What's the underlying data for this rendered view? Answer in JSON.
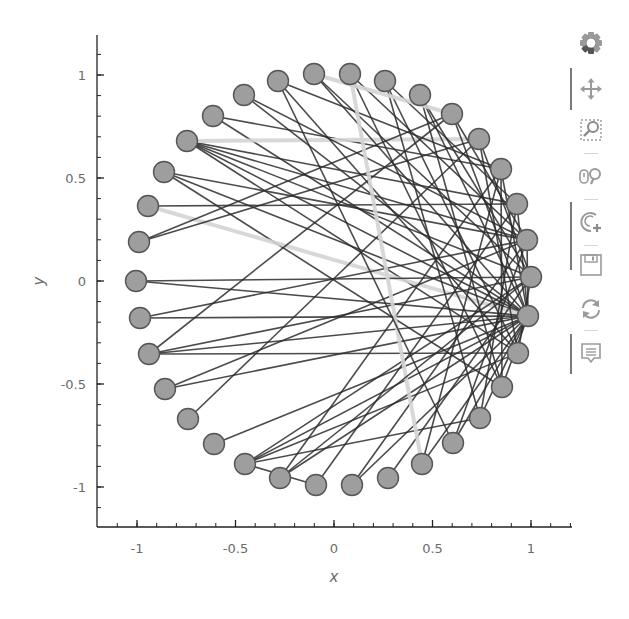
{
  "chart_data": {
    "type": "network-graph",
    "title": "",
    "xlabel": "x",
    "ylabel": "y",
    "xlim": [
      -1.2,
      1.2
    ],
    "ylim": [
      -1.2,
      1.2
    ],
    "x_ticks": [
      -1,
      -0.5,
      0,
      0.5,
      1
    ],
    "x_tick_labels": [
      "-1",
      "-0.5",
      "0",
      "0.5",
      "1"
    ],
    "y_ticks": [
      -1,
      -0.5,
      0,
      0.5,
      1
    ],
    "y_tick_labels": [
      "-1",
      "-0.5",
      "0",
      "0.5",
      "1"
    ],
    "grid": false,
    "layout": "circular",
    "node_count": 36,
    "node_color": "#9e9e9e",
    "node_outline": "#555555",
    "edge_color_dark": "#2b2b2b",
    "edge_color_light": "#d4d4d4",
    "nodes_px": [
      [
        531,
        277
      ],
      [
        527,
        240
      ],
      [
        517,
        204
      ],
      [
        501,
        169
      ],
      [
        479,
        139
      ],
      [
        452,
        114
      ],
      [
        420,
        95
      ],
      [
        385,
        81
      ],
      [
        350,
        74
      ],
      [
        314,
        74
      ],
      [
        278,
        81
      ],
      [
        244,
        95
      ],
      [
        213,
        116
      ],
      [
        187,
        141
      ],
      [
        164,
        172
      ],
      [
        148,
        206
      ],
      [
        139,
        242
      ],
      [
        136,
        281
      ],
      [
        140,
        318
      ],
      [
        149,
        354
      ],
      [
        165,
        389
      ],
      [
        188,
        419
      ],
      [
        214,
        444
      ],
      [
        245,
        464
      ],
      [
        280,
        478
      ],
      [
        316,
        485
      ],
      [
        352,
        485
      ],
      [
        388,
        478
      ],
      [
        422,
        464
      ],
      [
        453,
        443
      ],
      [
        480,
        418
      ],
      [
        502,
        387
      ],
      [
        518,
        353
      ],
      [
        528,
        316
      ]
    ],
    "edges": [
      [
        12,
        33,
        "d"
      ],
      [
        12,
        3,
        "d"
      ],
      [
        13,
        2,
        "d"
      ],
      [
        13,
        1,
        "d"
      ],
      [
        13,
        0,
        "d"
      ],
      [
        13,
        33,
        "d"
      ],
      [
        13,
        4,
        "l"
      ],
      [
        13,
        32,
        "d"
      ],
      [
        14,
        33,
        "d"
      ],
      [
        14,
        31,
        "d"
      ],
      [
        14,
        1,
        "d"
      ],
      [
        15,
        33,
        "l"
      ],
      [
        15,
        2,
        "d"
      ],
      [
        16,
        5,
        "d"
      ],
      [
        16,
        4,
        "d"
      ],
      [
        17,
        0,
        "d"
      ],
      [
        17,
        33,
        "d"
      ],
      [
        18,
        33,
        "d"
      ],
      [
        18,
        1,
        "d"
      ],
      [
        19,
        0,
        "d"
      ],
      [
        19,
        33,
        "d"
      ],
      [
        19,
        32,
        "d"
      ],
      [
        19,
        5,
        "d"
      ],
      [
        20,
        33,
        "d"
      ],
      [
        20,
        1,
        "d"
      ],
      [
        21,
        4,
        "d"
      ],
      [
        22,
        33,
        "d"
      ],
      [
        23,
        33,
        "d"
      ],
      [
        23,
        32,
        "d"
      ],
      [
        23,
        0,
        "d"
      ],
      [
        23,
        30,
        "d"
      ],
      [
        23,
        25,
        "d"
      ],
      [
        24,
        33,
        "d"
      ],
      [
        24,
        3,
        "d"
      ],
      [
        25,
        2,
        "d"
      ],
      [
        26,
        1,
        "d"
      ],
      [
        26,
        33,
        "d"
      ],
      [
        27,
        0,
        "d"
      ],
      [
        28,
        3,
        "d"
      ],
      [
        28,
        33,
        "d"
      ],
      [
        29,
        33,
        "d"
      ],
      [
        29,
        1,
        "d"
      ],
      [
        11,
        33,
        "d"
      ],
      [
        11,
        1,
        "d"
      ],
      [
        10,
        3,
        "d"
      ],
      [
        10,
        32,
        "d"
      ],
      [
        9,
        33,
        "d"
      ],
      [
        9,
        0,
        "d"
      ],
      [
        8,
        31,
        "d"
      ],
      [
        8,
        1,
        "d"
      ],
      [
        7,
        32,
        "d"
      ],
      [
        7,
        2,
        "d"
      ],
      [
        7,
        30,
        "d"
      ],
      [
        6,
        0,
        "d"
      ],
      [
        6,
        33,
        "d"
      ],
      [
        6,
        31,
        "d"
      ],
      [
        5,
        33,
        "d"
      ],
      [
        5,
        1,
        "d"
      ],
      [
        4,
        32,
        "d"
      ],
      [
        4,
        0,
        "d"
      ],
      [
        3,
        33,
        "d"
      ],
      [
        3,
        31,
        "d"
      ],
      [
        2,
        33,
        "d"
      ],
      [
        2,
        30,
        "d"
      ],
      [
        1,
        33,
        "d"
      ],
      [
        0,
        32,
        "d"
      ],
      [
        9,
        5,
        "l"
      ],
      [
        8,
        28,
        "l"
      ],
      [
        30,
        33,
        "d"
      ],
      [
        31,
        33,
        "d"
      ],
      [
        10,
        29,
        "d"
      ],
      [
        24,
        0,
        "d"
      ]
    ]
  },
  "axes": {
    "x_label": "x",
    "y_label": "y"
  },
  "toolbar": {
    "logo": "bokeh-logo-icon",
    "tools": [
      {
        "name": "pan",
        "icon": "pan-icon",
        "active": true
      },
      {
        "name": "box-zoom",
        "icon": "box-zoom-icon",
        "active": false
      },
      {
        "name": "wheel-zoom",
        "icon": "wheel-zoom-icon",
        "active": false
      },
      {
        "name": "zoom-in",
        "icon": "zoom-in-icon",
        "active": true
      },
      {
        "name": "save",
        "icon": "save-icon",
        "active": false
      },
      {
        "name": "reset",
        "icon": "reset-icon",
        "active": false
      },
      {
        "name": "hover",
        "icon": "hover-icon",
        "active": true
      }
    ]
  }
}
